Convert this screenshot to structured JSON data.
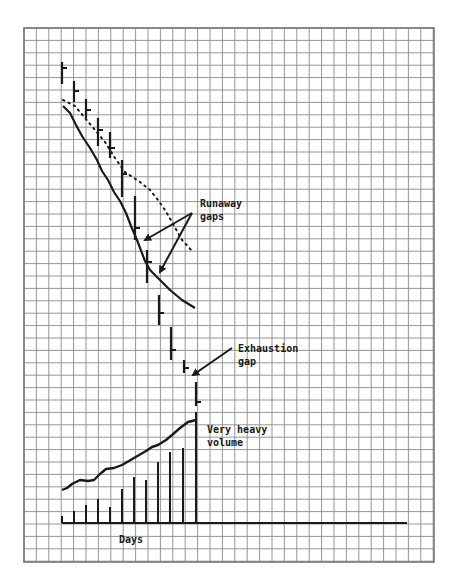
{
  "chart_data": {
    "type": "bar",
    "subtype": "price-bar-chart-with-volume",
    "title": "",
    "xlabel": "Days",
    "ylabel": "",
    "grid": true,
    "colors": {
      "ink": "#1a1a1a",
      "grid": "#8a8a8a",
      "background": "#ffffff"
    },
    "price_bars": [
      {
        "day": 1,
        "x": 62,
        "high": 62,
        "low": 84,
        "close": 68
      },
      {
        "day": 2,
        "x": 74,
        "high": 81,
        "low": 102,
        "close": 91
      },
      {
        "day": 3,
        "x": 86,
        "high": 99,
        "low": 118,
        "close": 110
      },
      {
        "day": 4,
        "x": 98,
        "high": 118,
        "low": 146,
        "close": 130
      },
      {
        "day": 5,
        "x": 110,
        "high": 132,
        "low": 158,
        "close": 148
      },
      {
        "day": 6,
        "x": 122,
        "high": 160,
        "low": 197,
        "close": 174
      },
      {
        "day": 7,
        "x": 135,
        "high": 196,
        "low": 240,
        "close": 228
      },
      {
        "day": 8,
        "x": 147,
        "high": 250,
        "low": 283,
        "close": 262
      },
      {
        "day": 9,
        "x": 159,
        "high": 295,
        "low": 325,
        "close": 313
      },
      {
        "day": 10,
        "x": 171,
        "high": 327,
        "low": 360,
        "close": 350
      },
      {
        "day": 11,
        "x": 184,
        "high": 360,
        "low": 373,
        "close": 368
      },
      {
        "day": 12,
        "x": 196,
        "high": 382,
        "low": 406,
        "close": 402
      }
    ],
    "solid_trend_line": [
      [
        63,
        106
      ],
      [
        70,
        113
      ],
      [
        76,
        125
      ],
      [
        82,
        136
      ],
      [
        90,
        148
      ],
      [
        97,
        160
      ],
      [
        102,
        171
      ],
      [
        108,
        180
      ],
      [
        114,
        192
      ],
      [
        120,
        201
      ],
      [
        126,
        213
      ],
      [
        131,
        226
      ],
      [
        137,
        240
      ],
      [
        145,
        261
      ],
      [
        150,
        270
      ],
      [
        160,
        280
      ],
      [
        170,
        290
      ],
      [
        182,
        300
      ],
      [
        195,
        308
      ]
    ],
    "dotted_trend_line": [
      [
        63,
        100
      ],
      [
        75,
        106
      ],
      [
        85,
        118
      ],
      [
        95,
        130
      ],
      [
        105,
        142
      ],
      [
        115,
        158
      ],
      [
        125,
        172
      ],
      [
        140,
        182
      ],
      [
        150,
        190
      ],
      [
        158,
        200
      ],
      [
        165,
        210
      ],
      [
        172,
        222
      ],
      [
        182,
        240
      ],
      [
        193,
        252
      ]
    ],
    "volume_baseline_y": 523,
    "volume_bars": [
      {
        "day": 1,
        "x": 62,
        "top": 516
      },
      {
        "day": 2,
        "x": 74,
        "top": 511
      },
      {
        "day": 3,
        "x": 86,
        "top": 505
      },
      {
        "day": 4,
        "x": 98,
        "top": 499
      },
      {
        "day": 5,
        "x": 110,
        "top": 507
      },
      {
        "day": 6,
        "x": 122,
        "top": 489
      },
      {
        "day": 7,
        "x": 134,
        "top": 477
      },
      {
        "day": 8,
        "x": 146,
        "top": 480
      },
      {
        "day": 9,
        "x": 158,
        "top": 462
      },
      {
        "day": 10,
        "x": 170,
        "top": 452
      },
      {
        "day": 11,
        "x": 183,
        "top": 448
      },
      {
        "day": 12,
        "x": 196,
        "top": 412
      }
    ],
    "volume_curve": [
      [
        62,
        490
      ],
      [
        67,
        488
      ],
      [
        72,
        484
      ],
      [
        80,
        480
      ],
      [
        88,
        481
      ],
      [
        94,
        480
      ],
      [
        100,
        474
      ],
      [
        106,
        469
      ],
      [
        114,
        468
      ],
      [
        122,
        465
      ],
      [
        134,
        458
      ],
      [
        146,
        451
      ],
      [
        152,
        447
      ],
      [
        158,
        445
      ],
      [
        166,
        440
      ],
      [
        172,
        435
      ],
      [
        180,
        428
      ],
      [
        188,
        422
      ],
      [
        192,
        421
      ],
      [
        196,
        420
      ]
    ],
    "axis": {
      "baseline_x_start": 62,
      "baseline_x_end": 407,
      "baseline_y": 523
    },
    "annotations": [
      {
        "id": "runaway",
        "lines": [
          "Runaway",
          "gaps"
        ],
        "x": 200,
        "y": 207,
        "arrows": [
          [
            [
              192,
              213
            ],
            [
              145,
              240
            ]
          ],
          [
            [
              192,
              213
            ],
            [
              160,
              272
            ]
          ]
        ]
      },
      {
        "id": "exhaustion",
        "lines": [
          "Exhaustion",
          "gap"
        ],
        "x": 238,
        "y": 352,
        "arrows": [
          [
            [
              232,
              348
            ],
            [
              193,
              375
            ]
          ]
        ]
      },
      {
        "id": "volume",
        "lines": [
          "Very heavy",
          "volume"
        ],
        "x": 207,
        "y": 433,
        "arrows": []
      }
    ],
    "plot_area": {
      "x": 24,
      "y": 28,
      "width": 410,
      "height": 534,
      "cell": 12.4
    }
  }
}
